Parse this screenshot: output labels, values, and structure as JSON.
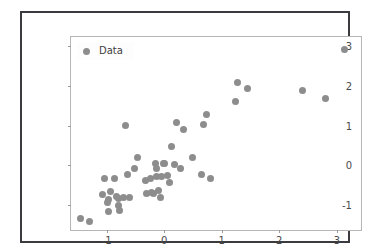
{
  "chart_data": {
    "type": "scatter",
    "title": "",
    "xlabel": "",
    "ylabel": "",
    "xlim": [
      -1.62,
      3.42
    ],
    "ylim": [
      -1.62,
      3.22
    ],
    "grid": false,
    "legend_position": "upper left",
    "marker_color": "#8d8d8d",
    "marker_size": 7,
    "background_color": "#ffffff",
    "axes_edge_color": "#b6b6b6",
    "figure_frame_color": "#3b3b3f",
    "xticks": [
      -1,
      0,
      1,
      2,
      3
    ],
    "xtick_labels": [
      "-1",
      "0",
      "1",
      "2",
      "3"
    ],
    "yticks": [
      -1,
      0,
      1,
      2,
      3
    ],
    "ytick_labels": [
      "-1",
      "0",
      "1",
      "2",
      "3"
    ],
    "series": [
      {
        "name": "Data",
        "points": [
          [
            -1.45,
            -1.33
          ],
          [
            -1.3,
            -1.4
          ],
          [
            -1.04,
            -0.34
          ],
          [
            -1.08,
            -0.74
          ],
          [
            -0.97,
            -0.86
          ],
          [
            -0.98,
            -0.92
          ],
          [
            -0.97,
            -1.15
          ],
          [
            -0.93,
            -0.66
          ],
          [
            -0.87,
            -0.33
          ],
          [
            -0.83,
            -0.79
          ],
          [
            -0.8,
            -0.83
          ],
          [
            -0.79,
            -1.01
          ],
          [
            -0.78,
            -1.13
          ],
          [
            -0.7,
            -0.8
          ],
          [
            -0.68,
            1.0
          ],
          [
            -0.63,
            -0.22
          ],
          [
            -0.6,
            -0.8
          ],
          [
            -0.52,
            -0.09
          ],
          [
            -0.47,
            0.21
          ],
          [
            -0.33,
            -0.37
          ],
          [
            -0.3,
            -0.71
          ],
          [
            -0.24,
            -0.32
          ],
          [
            -0.22,
            -0.68
          ],
          [
            -0.19,
            -0.7
          ],
          [
            -0.16,
            0.05
          ],
          [
            -0.14,
            -0.09
          ],
          [
            -0.13,
            -0.27
          ],
          [
            -0.1,
            -0.64
          ],
          [
            -0.07,
            -0.81
          ],
          [
            -0.05,
            -0.28
          ],
          [
            -0.02,
            0.04
          ],
          [
            0.01,
            0.04
          ],
          [
            0.05,
            -0.26
          ],
          [
            0.09,
            -0.44
          ],
          [
            0.13,
            0.47
          ],
          [
            0.18,
            0.02
          ],
          [
            0.21,
            1.08
          ],
          [
            0.28,
            -0.07
          ],
          [
            0.34,
            0.89
          ],
          [
            0.5,
            0.21
          ],
          [
            0.64,
            -0.22
          ],
          [
            0.68,
            1.03
          ],
          [
            0.74,
            1.27
          ],
          [
            0.8,
            -0.32
          ],
          [
            1.24,
            1.61
          ],
          [
            1.27,
            2.08
          ],
          [
            1.44,
            1.94
          ],
          [
            2.4,
            1.89
          ],
          [
            2.8,
            1.68
          ],
          [
            3.14,
            2.91
          ]
        ]
      }
    ]
  },
  "legend": {
    "label": "Data"
  }
}
